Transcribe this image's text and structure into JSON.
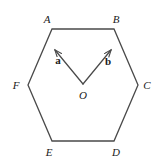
{
  "figure": {
    "kind": "geometry-diagram",
    "width": 164,
    "height": 167,
    "background_color": "#ffffff",
    "stroke_color": "#4a4a4a",
    "stroke_color_dark": "#3a3a3a",
    "text_color": "#1a1a1a",
    "stroke_width": 1.3
  },
  "hexagon": {
    "name": "ABCDEF",
    "vertices": [
      {
        "id": "A",
        "label": "A",
        "x": 52,
        "y": 29,
        "label_x": 47,
        "label_y": 19
      },
      {
        "id": "B",
        "label": "B",
        "x": 114,
        "y": 29,
        "label_x": 116,
        "label_y": 19
      },
      {
        "id": "C",
        "label": "C",
        "x": 138,
        "y": 85,
        "label_x": 147,
        "label_y": 85
      },
      {
        "id": "D",
        "label": "D",
        "x": 114,
        "y": 141,
        "label_x": 116,
        "label_y": 152
      },
      {
        "id": "E",
        "label": "E",
        "x": 52,
        "y": 141,
        "label_x": 49,
        "label_y": 152
      },
      {
        "id": "F",
        "label": "F",
        "x": 28,
        "y": 85,
        "label_x": 16,
        "label_y": 85
      }
    ],
    "edges": [
      "AB",
      "BC",
      "CD",
      "DE",
      "EF",
      "FA"
    ]
  },
  "centre": {
    "id": "O",
    "label": "O",
    "x": 83,
    "y": 84,
    "label_x": 83,
    "label_y": 95
  },
  "vectors": [
    {
      "id": "a",
      "label": "a",
      "from": "O",
      "to": "A",
      "x1": 83,
      "y1": 84,
      "x2": 55,
      "y2": 50,
      "label_x": 58,
      "label_y": 60
    },
    {
      "id": "b",
      "label": "b",
      "from": "O",
      "to": "B",
      "x1": 83,
      "y1": 84,
      "x2": 111,
      "y2": 50,
      "label_x": 108,
      "label_y": 61
    }
  ]
}
